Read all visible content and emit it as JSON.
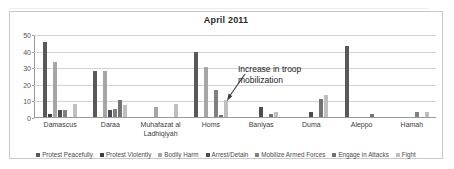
{
  "chart_data": {
    "type": "bar",
    "title": "April 2011",
    "xlabel": "",
    "ylabel": "",
    "ylim": [
      0,
      50
    ],
    "yticks": [
      0,
      10,
      20,
      30,
      40,
      50
    ],
    "grid": true,
    "legend_position": "bottom",
    "categories": [
      "Damascus",
      "Daraa",
      "Muhafazat al Ladhiqiyah",
      "Homs",
      "Baniyas",
      "Duma",
      "Aleppo",
      "Hamah"
    ],
    "series": [
      {
        "name": "Protest Peacefully",
        "color": "#595959",
        "values": [
          45,
          28,
          0,
          39,
          0,
          0,
          43,
          0
        ]
      },
      {
        "name": "Protest Violently",
        "color": "#3f3f3f",
        "values": [
          2,
          0,
          0,
          0,
          0,
          0,
          0,
          0
        ]
      },
      {
        "name": "Bodily Harm",
        "color": "#a6a6a6",
        "values": [
          33,
          28,
          6,
          30,
          0,
          0,
          0,
          0
        ]
      },
      {
        "name": "Arrest/Detain",
        "color": "#4d4d4d",
        "values": [
          4,
          4,
          0,
          0,
          6,
          3,
          0,
          0
        ]
      },
      {
        "name": "Mobilize Armed Forces",
        "color": "#808080",
        "values": [
          4,
          5,
          0,
          16,
          0,
          0,
          0,
          3
        ]
      },
      {
        "name": "Engage in Attacks",
        "color": "#737373",
        "values": [
          0,
          10,
          0,
          1,
          2,
          11,
          2,
          0
        ]
      },
      {
        "name": "Fight",
        "color": "#bfbfbf",
        "values": [
          8,
          7,
          8,
          10,
          3,
          13,
          0,
          3
        ]
      }
    ],
    "annotations": [
      {
        "text_line_1": "Increase in troop",
        "text_line_2": "mobilization",
        "points_to_category": "Homs",
        "points_to_series": "Mobilize Armed Forces"
      }
    ]
  }
}
